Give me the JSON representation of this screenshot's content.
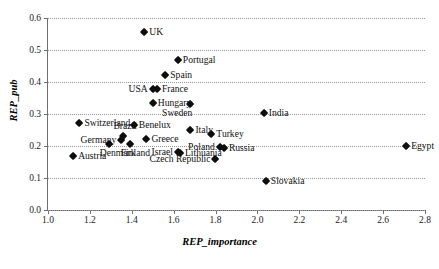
{
  "chart_data": {
    "type": "scatter",
    "title": "",
    "xlabel": "REP_importance",
    "ylabel": "REP_pub",
    "xlim": [
      1.0,
      2.8
    ],
    "ylim": [
      0.0,
      0.6
    ],
    "xticks": [
      "1.0",
      "1.2",
      "1.4",
      "1.6",
      "1.8",
      "2.0",
      "2.2",
      "2.4",
      "2.6",
      "2.8"
    ],
    "yticks": [
      "0.0",
      "0.1",
      "0.2",
      "0.3",
      "0.4",
      "0.5",
      "0.6"
    ],
    "grid": "horizontal-dotted",
    "legend": "none",
    "marker": "filled-diamond",
    "marker_color": "#0d0d0d",
    "points": [
      {
        "label": "UK",
        "x": 1.46,
        "y": 0.555,
        "pos": "right"
      },
      {
        "label": "Portugal",
        "x": 1.62,
        "y": 0.468,
        "pos": "right"
      },
      {
        "label": "Spain",
        "x": 1.56,
        "y": 0.422,
        "pos": "right"
      },
      {
        "label": "France",
        "x": 1.52,
        "y": 0.378,
        "pos": "right"
      },
      {
        "label": "USA",
        "x": 1.5,
        "y": 0.378,
        "pos": "left"
      },
      {
        "label": "Hungary",
        "x": 1.5,
        "y": 0.333,
        "pos": "right"
      },
      {
        "label": "Sweden",
        "x": 1.68,
        "y": 0.33,
        "pos": "below-left"
      },
      {
        "label": "India",
        "x": 2.03,
        "y": 0.302,
        "pos": "right"
      },
      {
        "label": "Switzerland",
        "x": 1.15,
        "y": 0.272,
        "pos": "right"
      },
      {
        "label": "Benelux",
        "x": 1.41,
        "y": 0.265,
        "pos": "right"
      },
      {
        "label": "Italy",
        "x": 1.68,
        "y": 0.25,
        "pos": "right"
      },
      {
        "label": "Brazil",
        "x": 1.36,
        "y": 0.232,
        "pos": "above"
      },
      {
        "label": "Greece",
        "x": 1.47,
        "y": 0.222,
        "pos": "right"
      },
      {
        "label": "Germany",
        "x": 1.35,
        "y": 0.218,
        "pos": "left"
      },
      {
        "label": "Turkey",
        "x": 1.78,
        "y": 0.238,
        "pos": "right"
      },
      {
        "label": "Denmark",
        "x": 1.29,
        "y": 0.205,
        "pos": "below"
      },
      {
        "label": "Finland",
        "x": 1.39,
        "y": 0.205,
        "pos": "below"
      },
      {
        "label": "Poland",
        "x": 1.82,
        "y": 0.196,
        "pos": "left"
      },
      {
        "label": "Russia",
        "x": 1.84,
        "y": 0.193,
        "pos": "right"
      },
      {
        "label": "Egypt",
        "x": 2.71,
        "y": 0.2,
        "pos": "right"
      },
      {
        "label": "Israel",
        "x": 1.62,
        "y": 0.18,
        "pos": "left"
      },
      {
        "label": "Lithuania",
        "x": 1.63,
        "y": 0.177,
        "pos": "right"
      },
      {
        "label": "Austria",
        "x": 1.12,
        "y": 0.17,
        "pos": "right"
      },
      {
        "label": "Czech Republic",
        "x": 1.8,
        "y": 0.16,
        "pos": "left"
      },
      {
        "label": "Slovakia",
        "x": 2.04,
        "y": 0.09,
        "pos": "right"
      }
    ]
  }
}
